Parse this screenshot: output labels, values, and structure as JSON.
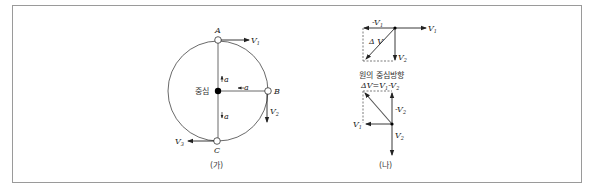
{
  "panel_a": {
    "caption": "(가)",
    "center_label": "중심",
    "points": {
      "a": "A",
      "b": "B",
      "c": "C"
    },
    "velocity_labels": {
      "v1_top": "V",
      "v1_top_sub": "1",
      "v2_right": "V",
      "v2_right_sub": "2",
      "v3_bottom": "V",
      "v3_bottom_sub": "3"
    },
    "accel_labels": {
      "top": "a",
      "right": "a",
      "bottom": "a"
    }
  },
  "panel_b": {
    "caption": "(나)",
    "top_vectors": {
      "v1": "V",
      "v1_sub": "1",
      "neg_v1": "-V",
      "neg_v1_sub": "1",
      "v2": "V",
      "v2_sub": "2",
      "delta_v": "Δ V"
    },
    "middle_caption": "원의 중심방향",
    "bottom_vectors": {
      "delta_eq": "ΔV=V",
      "delta_eq_sub1": "1",
      "delta_eq_mid": "-V",
      "delta_eq_sub2": "2",
      "v1": "V",
      "v1_sub": "1",
      "neg_v2": "-V",
      "neg_v2_sub": "2",
      "v2": "V",
      "v2_sub": "2"
    }
  },
  "colors": {
    "line": "#333333",
    "frame": "#9a9a9a",
    "dot": "#000000"
  }
}
